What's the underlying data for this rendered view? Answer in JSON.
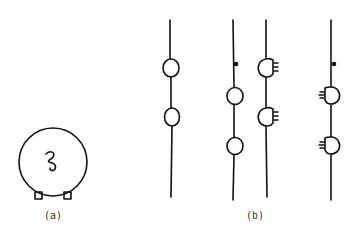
{
  "figure": {
    "panels": [
      {
        "id": "a",
        "label": "(a)",
        "description": "circular cell with coiled inclusion and two feet"
      },
      {
        "id": "b",
        "label": "(b)",
        "description": "four vertical threads with bead-like swellings; third and fourth with fringed swellings"
      }
    ],
    "stroke_color": "#111111",
    "background": "#ffffff"
  }
}
